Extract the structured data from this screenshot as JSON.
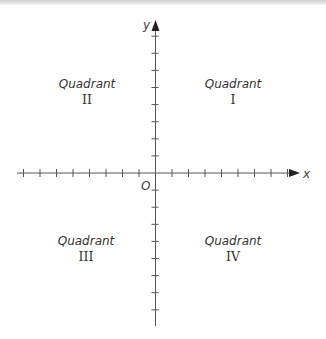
{
  "diagram": {
    "title": "",
    "axes": {
      "x_label": "x",
      "y_label": "y",
      "origin_label": "O",
      "ticks_per_half_axis": 8,
      "color": "#555555"
    },
    "quadrants": [
      {
        "id": "I",
        "word": "Quadrant",
        "numeral": "I"
      },
      {
        "id": "II",
        "word": "Quadrant",
        "numeral": "II"
      },
      {
        "id": "III",
        "word": "Quadrant",
        "numeral": "III"
      },
      {
        "id": "IV",
        "word": "Quadrant",
        "numeral": "IV"
      }
    ]
  }
}
